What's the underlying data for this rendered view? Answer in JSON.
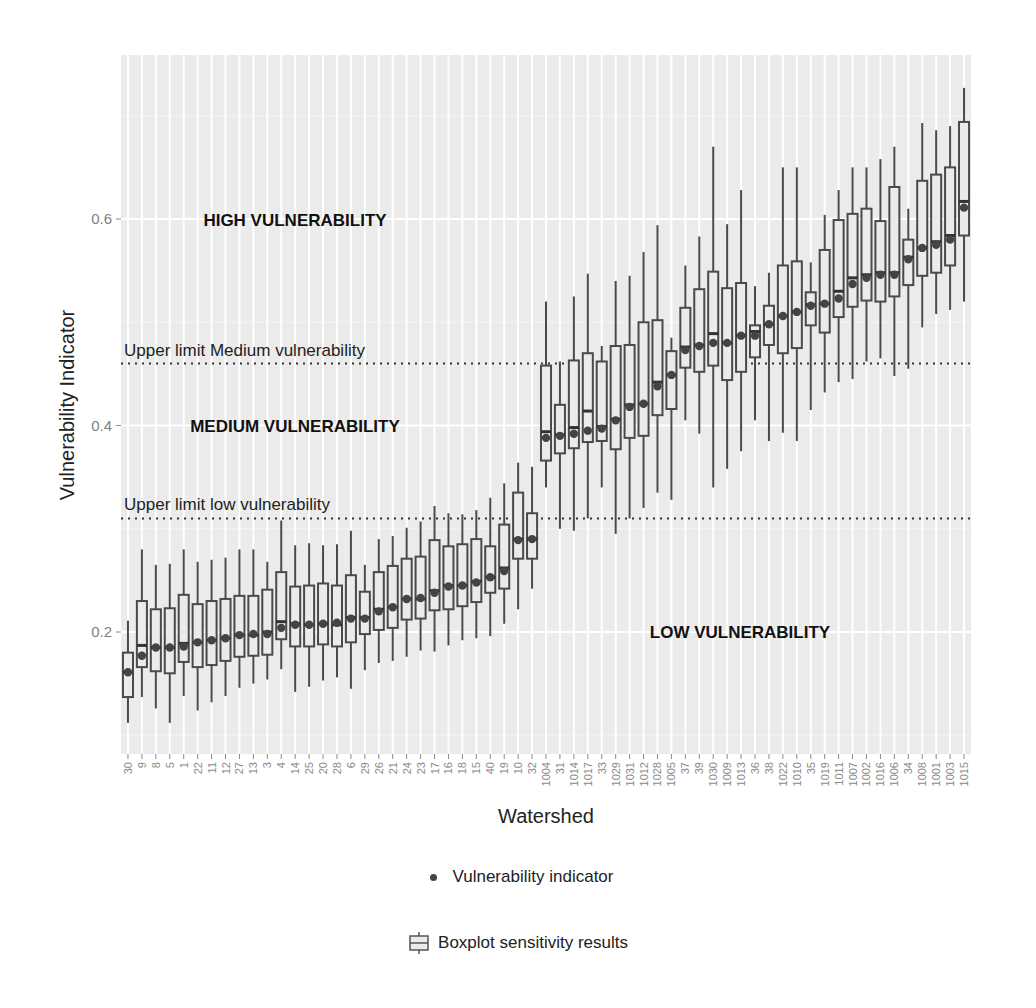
{
  "chart_data": {
    "type": "boxplot",
    "title": "",
    "xlabel": "Watershed",
    "ylabel": "Vulnerability Indicator",
    "ylim": [
      0.09,
      0.745
    ],
    "yticks": [
      0.2,
      0.4,
      0.6
    ],
    "ytick_labels": [
      "0.2",
      "0.4",
      "0.6"
    ],
    "grid": true,
    "legend_position": "bottom",
    "reference_lines": [
      {
        "name": "Upper limit Medium vulnerability",
        "value": 0.46,
        "style": "dotted"
      },
      {
        "name": "Upper limit low vulnerability",
        "value": 0.31,
        "style": "dotted"
      }
    ],
    "region_labels": [
      {
        "text": "HIGH VULNERABILITY",
        "x_category": "22",
        "y": 0.6
      },
      {
        "text": "MEDIUM VULNERABILITY",
        "x_category": "12",
        "y": 0.4
      },
      {
        "text": "LOW VULNERABILITY",
        "x_category": "1009",
        "y": 0.2
      }
    ],
    "categories": [
      "30",
      "9",
      "8",
      "5",
      "1",
      "22",
      "11",
      "12",
      "27",
      "13",
      "3",
      "4",
      "14",
      "25",
      "20",
      "28",
      "6",
      "29",
      "26",
      "21",
      "24",
      "23",
      "17",
      "16",
      "18",
      "15",
      "40",
      "19",
      "10",
      "32",
      "1004",
      "31",
      "1014",
      "1017",
      "33",
      "1029",
      "1031",
      "1012",
      "1028",
      "1005",
      "37",
      "39",
      "1030",
      "1009",
      "1013",
      "36",
      "38",
      "1022",
      "1010",
      "35",
      "1019",
      "1011",
      "1007",
      "1002",
      "1016",
      "1006",
      "34",
      "1008",
      "1001",
      "1003",
      "1015"
    ],
    "series": [
      {
        "name": "Boxplot sensitivity results",
        "type": "box",
        "whisker_low": [
          0.112,
          0.137,
          0.126,
          0.112,
          0.138,
          0.124,
          0.132,
          0.138,
          0.146,
          0.15,
          0.154,
          0.164,
          0.142,
          0.147,
          0.153,
          0.156,
          0.145,
          0.163,
          0.17,
          0.172,
          0.176,
          0.182,
          0.181,
          0.187,
          0.192,
          0.194,
          0.196,
          0.208,
          0.222,
          0.242,
          0.34,
          0.3,
          0.298,
          0.31,
          0.34,
          0.295,
          0.31,
          0.32,
          0.335,
          0.328,
          0.405,
          0.392,
          0.34,
          0.358,
          0.375,
          0.405,
          0.385,
          0.393,
          0.385,
          0.415,
          0.432,
          0.442,
          0.445,
          0.462,
          0.465,
          0.448,
          0.455,
          0.495,
          0.508,
          0.512,
          0.52
        ],
        "q1": [
          0.137,
          0.166,
          0.162,
          0.16,
          0.171,
          0.166,
          0.168,
          0.172,
          0.176,
          0.177,
          0.178,
          0.193,
          0.186,
          0.186,
          0.188,
          0.186,
          0.19,
          0.198,
          0.202,
          0.204,
          0.212,
          0.213,
          0.221,
          0.222,
          0.225,
          0.229,
          0.238,
          0.242,
          0.271,
          0.271,
          0.366,
          0.373,
          0.378,
          0.384,
          0.385,
          0.377,
          0.388,
          0.39,
          0.41,
          0.416,
          0.456,
          0.452,
          0.458,
          0.444,
          0.452,
          0.466,
          0.478,
          0.47,
          0.475,
          0.497,
          0.49,
          0.505,
          0.515,
          0.521,
          0.52,
          0.525,
          0.536,
          0.545,
          0.548,
          0.555,
          0.584
        ],
        "median": [
          0.161,
          0.187,
          0.185,
          0.185,
          0.189,
          0.19,
          0.192,
          0.194,
          0.197,
          0.197,
          0.2,
          0.21,
          0.208,
          0.207,
          0.208,
          0.207,
          0.214,
          0.214,
          0.222,
          0.224,
          0.232,
          0.232,
          0.24,
          0.245,
          0.245,
          0.249,
          0.253,
          0.262,
          0.29,
          0.29,
          0.394,
          0.391,
          0.398,
          0.414,
          0.399,
          0.406,
          0.42,
          0.421,
          0.442,
          0.449,
          0.476,
          0.478,
          0.489,
          0.48,
          0.487,
          0.491,
          0.498,
          0.506,
          0.51,
          0.517,
          0.518,
          0.53,
          0.543,
          0.546,
          0.548,
          0.548,
          0.563,
          0.572,
          0.578,
          0.584,
          0.617
        ],
        "q3": [
          0.18,
          0.23,
          0.222,
          0.223,
          0.236,
          0.227,
          0.23,
          0.232,
          0.235,
          0.235,
          0.241,
          0.258,
          0.244,
          0.245,
          0.247,
          0.245,
          0.255,
          0.239,
          0.258,
          0.264,
          0.271,
          0.273,
          0.289,
          0.283,
          0.285,
          0.29,
          0.283,
          0.304,
          0.335,
          0.315,
          0.458,
          0.42,
          0.463,
          0.47,
          0.462,
          0.477,
          0.478,
          0.5,
          0.502,
          0.472,
          0.514,
          0.532,
          0.549,
          0.533,
          0.538,
          0.497,
          0.516,
          0.555,
          0.559,
          0.529,
          0.57,
          0.599,
          0.605,
          0.61,
          0.598,
          0.631,
          0.58,
          0.637,
          0.643,
          0.65,
          0.694
        ],
        "whisker_high": [
          0.211,
          0.28,
          0.265,
          0.266,
          0.28,
          0.268,
          0.27,
          0.272,
          0.28,
          0.28,
          0.268,
          0.308,
          0.284,
          0.286,
          0.284,
          0.285,
          0.298,
          0.265,
          0.29,
          0.293,
          0.301,
          0.307,
          0.322,
          0.315,
          0.314,
          0.318,
          0.33,
          0.344,
          0.364,
          0.36,
          0.52,
          0.462,
          0.525,
          0.547,
          0.477,
          0.54,
          0.545,
          0.568,
          0.594,
          0.485,
          0.555,
          0.583,
          0.67,
          0.595,
          0.628,
          0.535,
          0.548,
          0.65,
          0.65,
          0.558,
          0.604,
          0.628,
          0.65,
          0.65,
          0.658,
          0.67,
          0.61,
          0.693,
          0.686,
          0.69,
          0.727
        ]
      },
      {
        "name": "Vulnerability indicator",
        "type": "point",
        "values": [
          0.161,
          0.177,
          0.185,
          0.185,
          0.186,
          0.19,
          0.192,
          0.194,
          0.197,
          0.198,
          0.198,
          0.204,
          0.207,
          0.207,
          0.208,
          0.209,
          0.213,
          0.213,
          0.22,
          0.224,
          0.232,
          0.233,
          0.238,
          0.244,
          0.245,
          0.248,
          0.253,
          0.259,
          0.289,
          0.29,
          0.388,
          0.39,
          0.392,
          0.395,
          0.397,
          0.405,
          0.418,
          0.421,
          0.438,
          0.449,
          0.473,
          0.477,
          0.48,
          0.48,
          0.487,
          0.487,
          0.498,
          0.506,
          0.51,
          0.516,
          0.518,
          0.523,
          0.537,
          0.543,
          0.546,
          0.546,
          0.561,
          0.572,
          0.575,
          0.58,
          0.611
        ]
      }
    ]
  },
  "legend": {
    "items": [
      {
        "label": "Vulnerability indicator",
        "icon": "dot-icon"
      },
      {
        "label": "Boxplot sensitivity results",
        "icon": "boxplot-icon"
      }
    ]
  },
  "colors": {
    "panel_bg": "#ebebeb",
    "gridline": "#ffffff",
    "box_stroke": "#4a4a4a",
    "box_fill": "#ebebeb",
    "point": "#444444",
    "reference_line": "#333333"
  }
}
